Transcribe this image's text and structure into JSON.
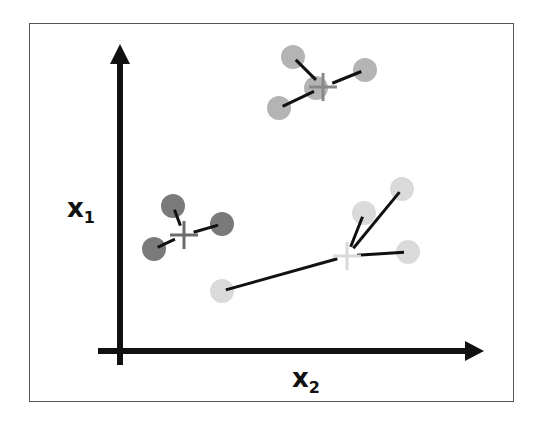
{
  "diagram": {
    "type": "k-means clustering illustration",
    "axes": {
      "vertical": {
        "label": "x",
        "subscript": "1"
      },
      "horizontal": {
        "label": "x",
        "subscript": "2"
      }
    },
    "colors": {
      "dark_cluster": "#7a7a7a",
      "medium_cluster": "#b4b4b4",
      "light_cluster": "#dadada",
      "lines": "#111111",
      "axes": "#111111",
      "border": "#555555"
    },
    "clusters": [
      {
        "name": "top-cluster",
        "shade": "medium",
        "centroid": {
          "x": 323,
          "y": 87
        },
        "points": [
          {
            "x": 293,
            "y": 57
          },
          {
            "x": 365,
            "y": 70
          },
          {
            "x": 279,
            "y": 108
          },
          {
            "x": 316,
            "y": 88
          }
        ]
      },
      {
        "name": "left-cluster",
        "shade": "dark",
        "centroid": {
          "x": 184,
          "y": 235
        },
        "points": [
          {
            "x": 173,
            "y": 206
          },
          {
            "x": 222,
            "y": 224
          },
          {
            "x": 154,
            "y": 249
          }
        ]
      },
      {
        "name": "right-cluster",
        "shade": "light",
        "centroid": {
          "x": 347,
          "y": 256
        },
        "points": [
          {
            "x": 402,
            "y": 189
          },
          {
            "x": 364,
            "y": 213
          },
          {
            "x": 408,
            "y": 252
          },
          {
            "x": 222,
            "y": 291
          }
        ]
      }
    ]
  }
}
